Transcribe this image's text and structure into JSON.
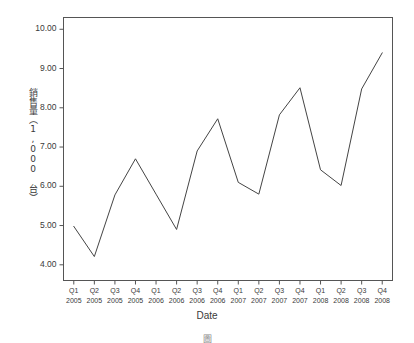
{
  "figure": {
    "background_color": "#ffffff",
    "frame_color": "#555555",
    "line_color": "#444444",
    "text_color": "#3a3a3a",
    "caption_stub": "圖"
  },
  "chart_data": {
    "type": "line",
    "title": "",
    "xlabel": "Date",
    "ylabel": "銷售量（1,000 台）",
    "ylim": [
      3.6,
      10.3
    ],
    "yticks": [
      "4.00",
      "5.00",
      "6.00",
      "7.00",
      "8.00",
      "9.00",
      "10.00"
    ],
    "ytick_values": [
      4,
      5,
      6,
      7,
      8,
      9,
      10
    ],
    "grid": false,
    "legend": "none",
    "categories": [
      "Q1 2005",
      "Q2 2005",
      "Q3 2005",
      "Q4 2005",
      "Q1 2006",
      "Q2 2006",
      "Q3 2006",
      "Q4 2006",
      "Q1 2007",
      "Q2 2007",
      "Q3 2007",
      "Q4 2007",
      "Q1 2008",
      "Q2 2008",
      "Q3 2008",
      "Q4 2008"
    ],
    "quarter_labels": [
      "Q1",
      "Q2",
      "Q3",
      "Q4",
      "Q1",
      "Q2",
      "Q3",
      "Q4",
      "Q1",
      "Q2",
      "Q3",
      "Q4",
      "Q1",
      "Q2",
      "Q3",
      "Q4"
    ],
    "year_labels": [
      "2005",
      "2005",
      "2005",
      "2005",
      "2006",
      "2006",
      "2006",
      "2006",
      "2007",
      "2007",
      "2007",
      "2007",
      "2008",
      "2008",
      "2008",
      "2008"
    ],
    "values": [
      4.98,
      4.21,
      5.78,
      6.7,
      5.8,
      4.9,
      6.9,
      7.72,
      6.1,
      5.8,
      7.82,
      8.51,
      6.42,
      6.02,
      8.48,
      9.4
    ]
  }
}
